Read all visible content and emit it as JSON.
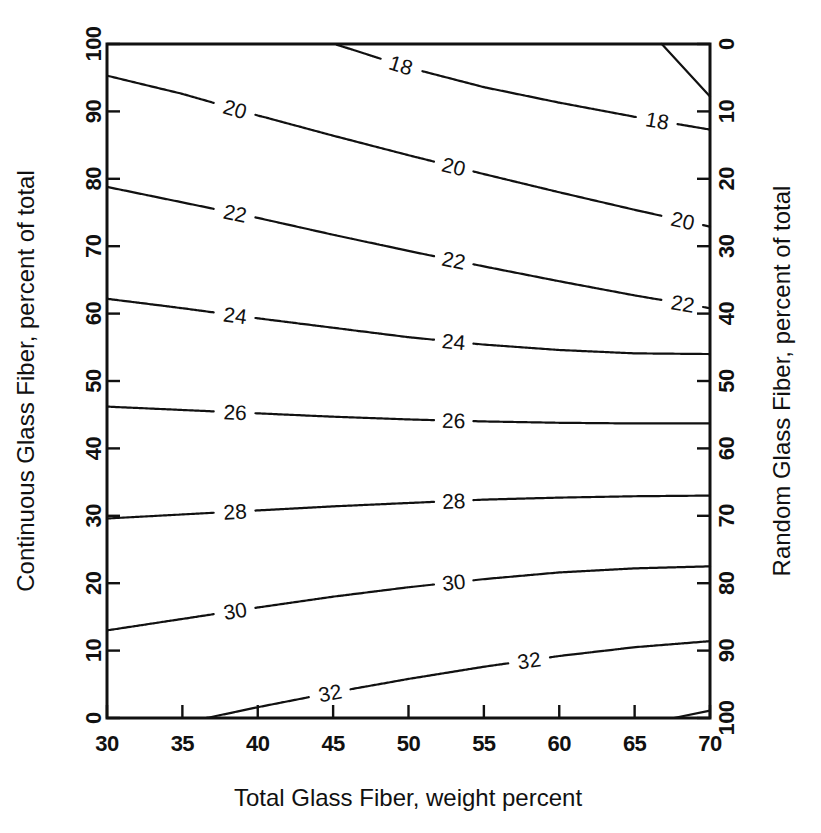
{
  "chart_data": {
    "type": "line",
    "subtype": "contour",
    "title": "",
    "xlabel": "Total Glass Fiber, weight percent",
    "ylabel": "Continuous Glass Fiber, percent of total",
    "y2label": "Random Glass Fiber, percent of total",
    "xlim": [
      30,
      70
    ],
    "ylim": [
      0,
      100
    ],
    "y2lim": [
      100,
      0
    ],
    "grid": false,
    "legend": null,
    "x_ticks": [
      30,
      35,
      40,
      45,
      50,
      55,
      60,
      65,
      70
    ],
    "x_tick_labels": [
      "30",
      "35",
      "40",
      "45",
      "50",
      "55",
      "60",
      "65",
      "70"
    ],
    "y_ticks": [
      0,
      10,
      20,
      30,
      40,
      50,
      60,
      70,
      80,
      90,
      100
    ],
    "y_tick_labels": [
      "0",
      "10",
      "20",
      "30",
      "40",
      "50",
      "60",
      "70",
      "80",
      "90",
      "100"
    ],
    "y2_ticks": [
      0,
      10,
      20,
      30,
      40,
      50,
      60,
      70,
      80,
      90,
      100
    ],
    "y2_tick_labels": [
      "0",
      "10",
      "20",
      "30",
      "40",
      "50",
      "60",
      "70",
      "80",
      "90",
      "100"
    ],
    "contour_levels": [
      16,
      18,
      20,
      22,
      24,
      26,
      28,
      30,
      32,
      34
    ],
    "contours": [
      {
        "level": 16,
        "label": "",
        "labeled": false,
        "points": [
          [
            66.8,
            100.0
          ],
          [
            70.0,
            92.2
          ]
        ]
      },
      {
        "level": 18,
        "label": "18",
        "labeled": true,
        "label_positions": [
          [
            49.5,
            96.0
          ],
          [
            66.5,
            87.5
          ]
        ],
        "points": [
          [
            45.1,
            100.0
          ],
          [
            50.0,
            96.5
          ],
          [
            55.0,
            93.6
          ],
          [
            60.0,
            91.3
          ],
          [
            65.0,
            89.2
          ],
          [
            70.0,
            87.3
          ]
        ]
      },
      {
        "level": 20,
        "label": "20",
        "labeled": true,
        "label_positions": [
          [
            38.5,
            91.0
          ],
          [
            53.0,
            81.5
          ],
          [
            68.2,
            72.5
          ]
        ],
        "points": [
          [
            30.0,
            95.3
          ],
          [
            35.0,
            92.6
          ],
          [
            40.0,
            89.4
          ],
          [
            45.0,
            86.4
          ],
          [
            50.0,
            83.5
          ],
          [
            55.0,
            80.7
          ],
          [
            60.0,
            78.0
          ],
          [
            65.0,
            75.4
          ],
          [
            70.0,
            72.9
          ]
        ]
      },
      {
        "level": 22,
        "label": "22",
        "labeled": true,
        "label_positions": [
          [
            38.5,
            74.5
          ],
          [
            53.0,
            67.5
          ],
          [
            68.2,
            60.5
          ]
        ],
        "points": [
          [
            30.0,
            78.8
          ],
          [
            35.0,
            76.5
          ],
          [
            40.0,
            74.2
          ],
          [
            45.0,
            71.7
          ],
          [
            50.0,
            69.3
          ],
          [
            55.0,
            67.0
          ],
          [
            60.0,
            64.8
          ],
          [
            65.0,
            62.7
          ],
          [
            70.0,
            60.8
          ]
        ]
      },
      {
        "level": 24,
        "label": "24",
        "labeled": true,
        "label_positions": [
          [
            38.5,
            59.5
          ],
          [
            53.0,
            55.0
          ]
        ],
        "points": [
          [
            30.0,
            62.2
          ],
          [
            35.0,
            60.8
          ],
          [
            40.0,
            59.3
          ],
          [
            45.0,
            57.9
          ],
          [
            50.0,
            56.5
          ],
          [
            55.0,
            55.4
          ],
          [
            60.0,
            54.6
          ],
          [
            65.0,
            54.1
          ],
          [
            70.0,
            54.0
          ]
        ]
      },
      {
        "level": 26,
        "label": "26",
        "labeled": true,
        "label_positions": [
          [
            38.5,
            45.2
          ],
          [
            53.0,
            44.2
          ]
        ],
        "points": [
          [
            30.0,
            46.2
          ],
          [
            35.0,
            45.7
          ],
          [
            40.0,
            45.2
          ],
          [
            45.0,
            44.7
          ],
          [
            50.0,
            44.3
          ],
          [
            55.0,
            44.0
          ],
          [
            60.0,
            43.8
          ],
          [
            65.0,
            43.7
          ],
          [
            70.0,
            43.7
          ]
        ]
      },
      {
        "level": 28,
        "label": "28",
        "labeled": true,
        "label_positions": [
          [
            38.5,
            30.8
          ],
          [
            53.0,
            32.2
          ]
        ],
        "points": [
          [
            30.0,
            29.6
          ],
          [
            35.0,
            30.2
          ],
          [
            40.0,
            30.8
          ],
          [
            45.0,
            31.4
          ],
          [
            50.0,
            31.9
          ],
          [
            55.0,
            32.4
          ],
          [
            60.0,
            32.7
          ],
          [
            65.0,
            32.9
          ],
          [
            70.0,
            33.0
          ]
        ]
      },
      {
        "level": 30,
        "label": "30",
        "labeled": true,
        "label_positions": [
          [
            38.5,
            16.2
          ],
          [
            53.0,
            20.2
          ]
        ],
        "points": [
          [
            30.0,
            13.0
          ],
          [
            35.0,
            14.7
          ],
          [
            40.0,
            16.4
          ],
          [
            45.0,
            18.0
          ],
          [
            50.0,
            19.4
          ],
          [
            55.0,
            20.6
          ],
          [
            60.0,
            21.6
          ],
          [
            65.0,
            22.2
          ],
          [
            70.0,
            22.5
          ]
        ]
      },
      {
        "level": 32,
        "label": "32",
        "labeled": true,
        "label_positions": [
          [
            44.8,
            2.6
          ],
          [
            58.0,
            7.8
          ]
        ],
        "points": [
          [
            36.6,
            0.0
          ],
          [
            40.0,
            1.6
          ],
          [
            45.0,
            3.8
          ],
          [
            50.0,
            5.8
          ],
          [
            55.0,
            7.6
          ],
          [
            60.0,
            9.2
          ],
          [
            65.0,
            10.5
          ],
          [
            70.0,
            11.4
          ]
        ]
      },
      {
        "level": 34,
        "label": "",
        "labeled": false,
        "points": [
          [
            67.6,
            0.0
          ],
          [
            70.0,
            1.1
          ]
        ]
      }
    ]
  }
}
